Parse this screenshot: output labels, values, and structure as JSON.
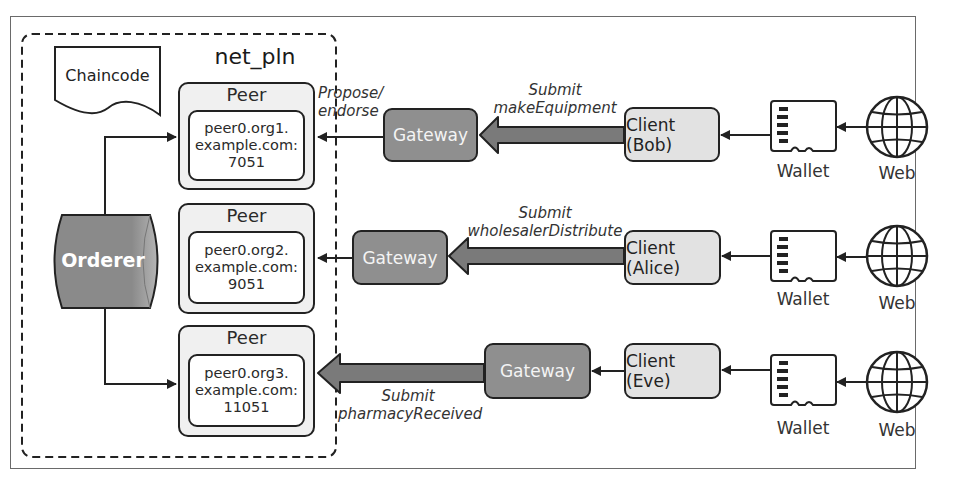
{
  "diagram": {
    "network": {
      "title": "net_pln",
      "chaincode_label": "Chaincode",
      "orderer_label": "Orderer",
      "peers": [
        {
          "title": "Peer",
          "lines": [
            "peer0.org1.",
            "example.com:",
            "7051"
          ]
        },
        {
          "title": "Peer",
          "lines": [
            "peer0.org2.",
            "example.com:",
            "9051"
          ]
        },
        {
          "title": "Peer",
          "lines": [
            "peer0.org3.",
            "example.com:",
            "11051"
          ]
        }
      ]
    },
    "flows": [
      {
        "gateway_label": "Gateway",
        "client_label": "Client (Bob)",
        "submit_lines": [
          "Submit",
          "makeEquipment"
        ],
        "endorse_lines": [
          "Propose/",
          "endorse"
        ],
        "wallet_label": "Wallet",
        "web_label": "Web"
      },
      {
        "gateway_label": "Gateway",
        "client_label": "Client (Alice)",
        "submit_lines": [
          "Submit",
          "wholesalerDistribute"
        ],
        "wallet_label": "Wallet",
        "web_label": "Web"
      },
      {
        "gateway_label": "Gateway",
        "client_label": "Client (Eve)",
        "submit_lines": [
          "Submit",
          "pharmacyReceived"
        ],
        "wallet_label": "Wallet",
        "web_label": "Web"
      }
    ],
    "icons": {
      "wallet": "sd-card-icon",
      "web": "globe-icon",
      "chaincode": "document-icon",
      "orderer": "cylinder-database-icon"
    },
    "colors": {
      "gateway_fill": "#8f8f8f",
      "client_fill": "#e2e2e2",
      "peer_fill": "#f0f0f0",
      "orderer_fill": "#8a8a8a",
      "arrow_fill": "#7a7a7a",
      "stroke": "#222222"
    }
  }
}
